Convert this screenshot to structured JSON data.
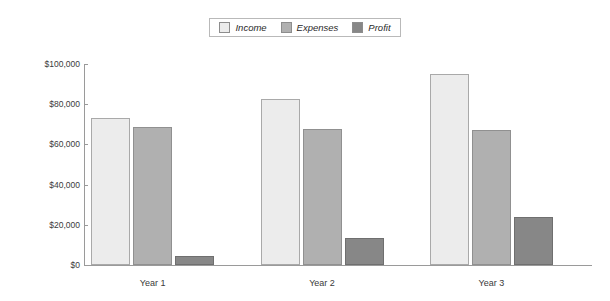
{
  "chart_data": {
    "type": "bar",
    "title": "",
    "subtitle": "",
    "xlabel": "",
    "ylabel": "",
    "categories": [
      "Year 1",
      "Year 2",
      "Year 3"
    ],
    "series": [
      {
        "name": "Income",
        "values": [
          73000,
          82500,
          95000
        ],
        "color": "#ececec"
      },
      {
        "name": "Expenses",
        "values": [
          68500,
          67500,
          67000
        ],
        "color": "#b0b0b0"
      },
      {
        "name": "Profit",
        "values": [
          4500,
          13500,
          24000
        ],
        "color": "#878787"
      }
    ],
    "ylim": [
      0,
      100000
    ],
    "yticks": [
      0,
      20000,
      40000,
      60000,
      80000,
      100000
    ],
    "ytick_labels": [
      "$0",
      "$20,000",
      "$40,000",
      "$60,000",
      "$80,000",
      "$100,000"
    ],
    "grid": false,
    "legend_position": "top-center",
    "legend_italic": true,
    "orientation": "vertical",
    "grouping": "clustered"
  },
  "legend": {
    "items": [
      {
        "label": "Income",
        "swatch_color": "#ececec"
      },
      {
        "label": "Expenses",
        "swatch_color": "#b0b0b0"
      },
      {
        "label": "Profit",
        "swatch_color": "#878787"
      }
    ]
  },
  "axes": {
    "y_labels": [
      "$100,000",
      "$80,000",
      "$60,000",
      "$40,000",
      "$20,000",
      "$0"
    ],
    "x_labels": [
      "Year 1",
      "Year 2",
      "Year 3"
    ]
  }
}
